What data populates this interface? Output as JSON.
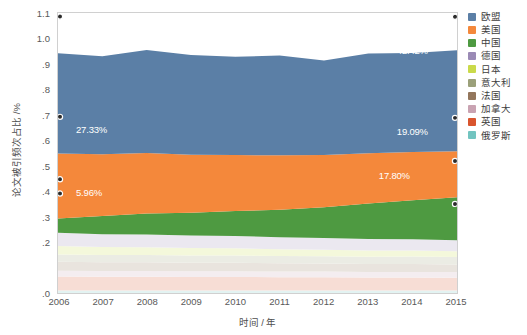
{
  "chart_data": {
    "type": "area",
    "title": "",
    "subtitle": "",
    "xlabel": "时间 / 年",
    "ylabel": "论文被引频次占比 /%",
    "stacked": true,
    "grid": false,
    "legend_position": "right",
    "xlim": [
      2006,
      2015
    ],
    "ylim": [
      0.0,
      1.1
    ],
    "x": [
      2006,
      2007,
      2008,
      2009,
      2010,
      2011,
      2012,
      2013,
      2014,
      2015
    ],
    "categories": [
      "2006",
      "2007",
      "2008",
      "2009",
      "2010",
      "2011",
      "2012",
      "2013",
      "2014",
      "2015"
    ],
    "ytick_labels": [
      "1.1",
      "1.0",
      ".9",
      ".8",
      ".7",
      ".6",
      ".5",
      ".4",
      ".3",
      ".2",
      ".1",
      ".0"
    ],
    "ytick_values": [
      1.1,
      1.0,
      0.9,
      0.8,
      0.7,
      0.6,
      0.5,
      0.4,
      0.3,
      0.2,
      0.1,
      0.0
    ],
    "series": [
      {
        "name": "欧盟",
        "color": "#5b7fa6",
        "faded": false,
        "values": [
          0.394,
          0.385,
          0.405,
          0.392,
          0.386,
          0.392,
          0.371,
          0.392,
          0.389,
          0.397
        ]
      },
      {
        "name": "美国",
        "color": "#f4883b",
        "faded": false,
        "values": [
          0.255,
          0.242,
          0.238,
          0.228,
          0.22,
          0.214,
          0.205,
          0.197,
          0.19,
          0.181
        ]
      },
      {
        "name": "中国",
        "color": "#4e9a41",
        "faded": false,
        "values": [
          0.056,
          0.072,
          0.082,
          0.089,
          0.098,
          0.108,
          0.121,
          0.14,
          0.153,
          0.169
        ]
      },
      {
        "name": "德国",
        "color": "#9a8ab5",
        "faded": true,
        "values": [
          0.052,
          0.05,
          0.05,
          0.049,
          0.048,
          0.047,
          0.046,
          0.045,
          0.044,
          0.043
        ]
      },
      {
        "name": "日本",
        "color": "#cada4a",
        "faded": true,
        "values": [
          0.034,
          0.032,
          0.031,
          0.03,
          0.029,
          0.027,
          0.026,
          0.025,
          0.024,
          0.023
        ]
      },
      {
        "name": "意大利",
        "color": "#9ba07a",
        "faded": true,
        "values": [
          0.028,
          0.028,
          0.028,
          0.028,
          0.028,
          0.028,
          0.028,
          0.028,
          0.029,
          0.029
        ]
      },
      {
        "name": "法国",
        "color": "#93765c",
        "faded": true,
        "values": [
          0.036,
          0.035,
          0.035,
          0.034,
          0.034,
          0.033,
          0.032,
          0.031,
          0.031,
          0.03
        ]
      },
      {
        "name": "加拿大",
        "color": "#c9a3b2",
        "faded": true,
        "values": [
          0.022,
          0.022,
          0.022,
          0.022,
          0.022,
          0.022,
          0.022,
          0.022,
          0.022,
          0.022
        ]
      },
      {
        "name": "英国",
        "color": "#d9552e",
        "faded": true,
        "values": [
          0.055,
          0.054,
          0.054,
          0.053,
          0.053,
          0.052,
          0.052,
          0.051,
          0.051,
          0.05
        ]
      },
      {
        "name": "俄罗斯",
        "color": "#72c4c0",
        "faded": true,
        "values": [
          0.01,
          0.01,
          0.01,
          0.01,
          0.01,
          0.01,
          0.01,
          0.01,
          0.01,
          0.01
        ]
      }
    ],
    "annotations": [
      {
        "text": "42.37%",
        "series": "欧盟",
        "x": 2006,
        "x_px": 0.045,
        "y_px": 0.115
      },
      {
        "text": "42.42%",
        "series": "欧盟",
        "x": 2015,
        "x_px": 0.845,
        "y_px": 0.115
      },
      {
        "text": "27.33%",
        "series": "美国",
        "x": 2006,
        "x_px": 0.045,
        "y_px": 0.395
      },
      {
        "text": "19.09%",
        "series": "美国",
        "x": 2015,
        "x_px": 0.845,
        "y_px": 0.4
      },
      {
        "text": "5.96%",
        "series": "中国",
        "x": 2006,
        "x_px": 0.045,
        "y_px": 0.617
      },
      {
        "text": "17.80%",
        "series": "中国",
        "x": 2015,
        "x_px": 0.8,
        "y_px": 0.555
      }
    ],
    "markers": [
      {
        "x": 2006,
        "y": 1.086
      },
      {
        "x": 2015,
        "y": 1.085
      },
      {
        "x": 2006,
        "y": 0.692
      },
      {
        "x": 2015,
        "y": 0.688
      },
      {
        "x": 2006,
        "y": 0.447
      },
      {
        "x": 2015,
        "y": 0.519
      },
      {
        "x": 2006,
        "y": 0.391
      },
      {
        "x": 2015,
        "y": 0.35
      }
    ]
  },
  "legend": {
    "items": [
      {
        "label": "欧盟",
        "color": "#5b7fa6"
      },
      {
        "label": "美国",
        "color": "#f4883b"
      },
      {
        "label": "中国",
        "color": "#4e9a41"
      },
      {
        "label": "德国",
        "color": "#9a8ab5"
      },
      {
        "label": "日本",
        "color": "#cada4a"
      },
      {
        "label": "意大利",
        "color": "#9ba07a"
      },
      {
        "label": "法国",
        "color": "#93765c"
      },
      {
        "label": "加拿大",
        "color": "#c9a3b2"
      },
      {
        "label": "英国",
        "color": "#d9552e"
      },
      {
        "label": "俄罗斯",
        "color": "#72c4c0"
      }
    ]
  }
}
